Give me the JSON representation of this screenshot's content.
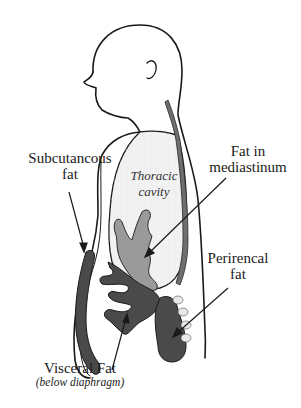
{
  "diagram": {
    "colors": {
      "background": "#ffffff",
      "outline": "#1a1a1a",
      "cavity_fill": "#efefef",
      "mediastinal_fat": "#9a9a9a",
      "dark_fat": "#4a4a4a"
    },
    "labels": {
      "subcutaneous": {
        "line1": "Subcutancous",
        "line2": "fat"
      },
      "mediastinum": {
        "line1": "Fat in",
        "line2": "mediastinum"
      },
      "thoracic": {
        "line1": "Thoracic",
        "line2": "cavity"
      },
      "perirenal": {
        "line1": "Perirencal",
        "line2": "fat"
      },
      "visceral": {
        "line1": "Visceral Fat",
        "line2": "(below diaphragm)"
      }
    }
  }
}
